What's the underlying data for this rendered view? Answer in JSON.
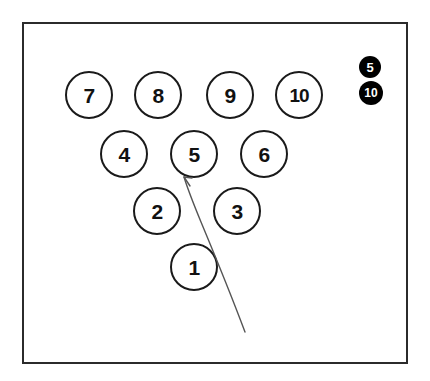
{
  "diagram": {
    "type": "bowling-pin-deck",
    "frame": {
      "border_color": "#2b2b2b",
      "background_color": "#ffffff",
      "x": 22,
      "y": 22,
      "width": 386,
      "height": 342
    },
    "pin_style": {
      "outline_color": "#1a1a1a",
      "fill_color": "#ffffff",
      "text_color": "#111111",
      "diameter": 48
    },
    "rows": [
      {
        "row_name": "back-row",
        "pins": [
          {
            "label": "7",
            "cx": 87,
            "cy": 93
          },
          {
            "label": "8",
            "cx": 156,
            "cy": 93
          },
          {
            "label": "9",
            "cx": 228,
            "cy": 93
          },
          {
            "label": "10",
            "cx": 297,
            "cy": 93,
            "wide": true
          }
        ]
      },
      {
        "row_name": "third-row",
        "pins": [
          {
            "label": "4",
            "cx": 122,
            "cy": 152
          },
          {
            "label": "5",
            "cx": 192,
            "cy": 152
          },
          {
            "label": "6",
            "cx": 262,
            "cy": 152
          }
        ]
      },
      {
        "row_name": "second-row",
        "pins": [
          {
            "label": "2",
            "cx": 155,
            "cy": 209
          },
          {
            "label": "3",
            "cx": 235,
            "cy": 209
          }
        ]
      },
      {
        "row_name": "head-pin-row",
        "pins": [
          {
            "label": "1",
            "cx": 192,
            "cy": 265
          }
        ]
      }
    ],
    "markers": [
      {
        "label": "5",
        "cx": 368,
        "cy": 65,
        "diameter": 22,
        "font_size": 13,
        "fill_color": "#000000",
        "text_color": "#ffffff"
      },
      {
        "label": "10",
        "cx": 369,
        "cy": 91,
        "diameter": 24,
        "font_size": 12,
        "fill_color": "#000000",
        "text_color": "#ffffff"
      }
    ],
    "ball_path": {
      "name": "ball-path-curve",
      "stroke_color": "#555555",
      "stroke_width": 1.4,
      "start": {
        "x": 245,
        "y": 332
      },
      "end": {
        "x": 184,
        "y": 177
      },
      "arrowhead": "at-end-pointing-up-left",
      "path_d": "M 245 332 C 233 300 216 258 201 222 C 194 205 188 190 184 177"
    }
  }
}
